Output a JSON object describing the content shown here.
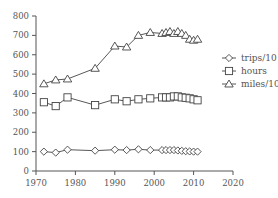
{
  "chart_data": {
    "type": "line",
    "title": "",
    "xlabel": "",
    "ylabel": "",
    "xlim": [
      1970,
      2020
    ],
    "ylim": [
      0,
      800
    ],
    "x_ticks": [
      1970,
      1980,
      1990,
      2000,
      2010,
      2020
    ],
    "y_ticks": [
      0,
      100,
      200,
      300,
      400,
      500,
      600,
      700,
      800
    ],
    "grid": false,
    "legend_position": "right",
    "series": [
      {
        "name": "trips/10",
        "marker": "diamond",
        "x": [
          1972,
          1975,
          1978,
          1985,
          1990,
          1993,
          1996,
          1999,
          2002,
          2003,
          2004,
          2005,
          2006,
          2007,
          2008,
          2009,
          2010,
          2011
        ],
        "values": [
          100,
          95,
          110,
          105,
          110,
          108,
          112,
          108,
          108,
          108,
          108,
          108,
          106,
          104,
          102,
          101,
          100,
          100
        ]
      },
      {
        "name": "hours",
        "marker": "square",
        "x": [
          1972,
          1975,
          1978,
          1985,
          1990,
          1993,
          1996,
          1999,
          2002,
          2003,
          2004,
          2005,
          2006,
          2007,
          2008,
          2009,
          2010,
          2011
        ],
        "values": [
          355,
          335,
          380,
          340,
          370,
          360,
          370,
          375,
          380,
          380,
          380,
          385,
          385,
          380,
          378,
          375,
          370,
          365
        ]
      },
      {
        "name": "miles/10",
        "marker": "triangle",
        "x": [
          1972,
          1975,
          1978,
          1985,
          1990,
          1993,
          1996,
          1999,
          2002,
          2003,
          2004,
          2005,
          2006,
          2007,
          2008,
          2009,
          2010,
          2011
        ],
        "values": [
          450,
          470,
          475,
          530,
          645,
          640,
          700,
          715,
          710,
          715,
          720,
          710,
          720,
          710,
          700,
          680,
          675,
          680
        ]
      }
    ]
  },
  "legend": {
    "items": [
      {
        "label": "trips/10",
        "marker": "diamond"
      },
      {
        "label": "hours",
        "marker": "square"
      },
      {
        "label": "miles/10",
        "marker": "triangle"
      }
    ]
  },
  "axis": {
    "x_tick_labels": [
      "1970",
      "1980",
      "1990",
      "2000",
      "2010",
      "2020"
    ],
    "y_tick_labels": [
      "0",
      "100",
      "200",
      "300",
      "400",
      "500",
      "600",
      "700",
      "800"
    ]
  },
  "colors": {
    "line": "#444444",
    "axis": "#555555",
    "marker_fill": "#ffffff"
  }
}
